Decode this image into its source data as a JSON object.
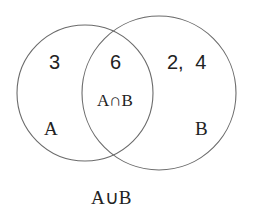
{
  "diagram": {
    "type": "venn",
    "stroke_color": "#6b6b6b",
    "background": "#ffffff",
    "sets": [
      {
        "name": "A",
        "label": "A",
        "only_elements": "3"
      },
      {
        "name": "B",
        "label": "B",
        "only_elements": "2, 4"
      }
    ],
    "intersection": {
      "label": "A∩B",
      "elements": "6"
    },
    "union_label": "A∪B"
  }
}
